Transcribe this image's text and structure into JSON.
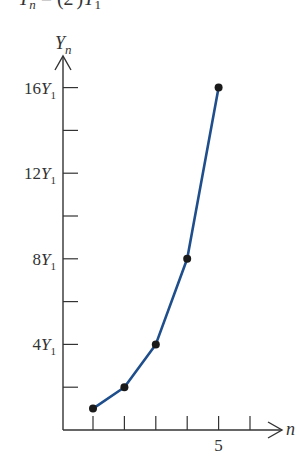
{
  "header": {
    "equation_partial": "Y_n = (2^(n-1))Y_1"
  },
  "chart_data": {
    "type": "line",
    "title": "",
    "xlabel": "n",
    "ylabel": "Y_n",
    "x": [
      1,
      2,
      3,
      4,
      5
    ],
    "series": [
      {
        "name": "Y_n",
        "values": [
          1,
          2,
          4,
          8,
          16
        ],
        "unit": "Y_1",
        "color": "#1f4e8c",
        "markers": true
      }
    ],
    "x_ticks": [
      1,
      2,
      3,
      4,
      5,
      6
    ],
    "x_tick_labels": [
      {
        "value": 5,
        "label": "5"
      }
    ],
    "y_ticks": [
      2,
      4,
      6,
      8,
      10,
      12,
      14,
      16
    ],
    "y_tick_labels": [
      {
        "value": 4,
        "label": "4Y",
        "sub": "1"
      },
      {
        "value": 8,
        "label": "8Y",
        "sub": "1"
      },
      {
        "value": 12,
        "label": "12Y",
        "sub": "1"
      },
      {
        "value": 16,
        "label": "16Y",
        "sub": "1"
      }
    ],
    "xlim": [
      0,
      6.5
    ],
    "ylim": [
      0,
      17.5
    ],
    "grid": false,
    "legend": "none"
  },
  "colors": {
    "axis": "#333333",
    "line": "#1f4e8c",
    "marker": "#1a1a1a"
  }
}
